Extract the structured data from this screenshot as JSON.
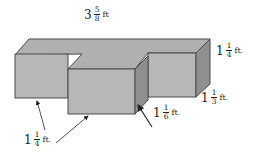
{
  "diagram": {
    "type": "3d-composite-rectangular-prism",
    "colors": {
      "front_face": "#b7b7b7",
      "top_face": "#b0b0b0",
      "side_face": "#8f8f8f",
      "edge": "#4a4a4a"
    },
    "labels": {
      "length": {
        "whole": "3",
        "num": "5",
        "den": "8",
        "unit": "ft"
      },
      "right_height": {
        "whole": "1",
        "num": "1",
        "den": "4",
        "unit": "ft."
      },
      "right_depth": {
        "whole": "1",
        "num": "1",
        "den": "3",
        "unit": "ft."
      },
      "middle_depth": {
        "whole": "1",
        "num": "1",
        "den": "6",
        "unit": "ft."
      },
      "bottom_height": {
        "whole": "1",
        "num": "1",
        "den": "4",
        "unit": "ft."
      }
    }
  }
}
